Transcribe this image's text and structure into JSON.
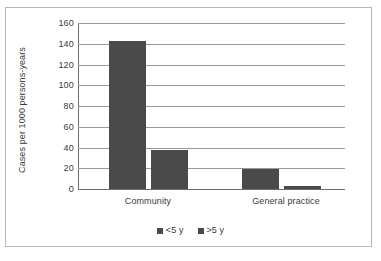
{
  "chart_data": {
    "type": "bar",
    "title": "",
    "xlabel": "",
    "ylabel": "Cases per 1000 persons-years",
    "ylim": [
      0,
      160
    ],
    "yticks": [
      0,
      20,
      40,
      60,
      80,
      100,
      120,
      140,
      160
    ],
    "ytick_labels": [
      "0",
      "20",
      "40",
      "60",
      "80",
      "100",
      "120",
      "140",
      "160"
    ],
    "categories": [
      "Community",
      "General practice"
    ],
    "grid": "horizontal",
    "legend_position": "bottom-center",
    "series": [
      {
        "name": "<5 y",
        "values": [
          143,
          19
        ],
        "color": "#4a4a4a"
      },
      {
        "name": ">5 y",
        "values": [
          38,
          2.5
        ],
        "color": "#4a4a4a"
      }
    ]
  },
  "colors": {
    "bar_fill": "#4a4a4a",
    "gridline": "#9a9a9a",
    "axis": "#6e6e6e",
    "frame": "#b8b8b8",
    "text": "#3b3b3b",
    "background": "#ffffff"
  }
}
